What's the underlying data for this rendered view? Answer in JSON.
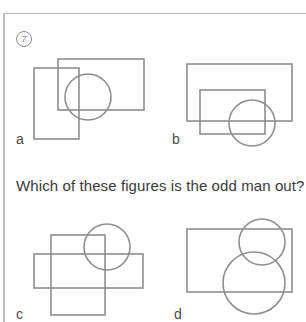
{
  "puzzle": {
    "number": "7",
    "question": "Which of these figures is the odd man out?"
  },
  "colors": {
    "stroke": "#8e8e8e",
    "text": "#3a3a3a",
    "rule": "#bdbdbd",
    "background": "#ffffff"
  },
  "figures": [
    {
      "label": "a",
      "shapes": [
        {
          "type": "rect",
          "x": 34,
          "y": 68,
          "w": 45,
          "h": 71
        },
        {
          "type": "rect",
          "x": 58,
          "y": 59,
          "w": 86,
          "h": 51
        },
        {
          "type": "circle",
          "cx": 88,
          "cy": 97,
          "r": 23
        }
      ]
    },
    {
      "label": "b",
      "shapes": [
        {
          "type": "rect",
          "x": 187,
          "y": 64,
          "w": 105,
          "h": 57
        },
        {
          "type": "rect",
          "x": 200,
          "y": 90,
          "w": 65,
          "h": 44
        },
        {
          "type": "circle",
          "cx": 252,
          "cy": 123,
          "r": 23
        }
      ]
    },
    {
      "label": "c",
      "shapes": [
        {
          "type": "rect",
          "x": 51,
          "y": 235,
          "w": 54,
          "h": 80
        },
        {
          "type": "rect",
          "x": 34,
          "y": 254,
          "w": 109,
          "h": 34
        },
        {
          "type": "circle",
          "cx": 107,
          "cy": 247,
          "r": 23
        }
      ]
    },
    {
      "label": "d",
      "shapes": [
        {
          "type": "rect",
          "x": 187,
          "y": 229,
          "w": 105,
          "h": 63
        },
        {
          "type": "circle",
          "cx": 262,
          "cy": 242,
          "r": 23
        },
        {
          "type": "circle",
          "cx": 254,
          "cy": 283,
          "r": 31
        }
      ]
    }
  ]
}
